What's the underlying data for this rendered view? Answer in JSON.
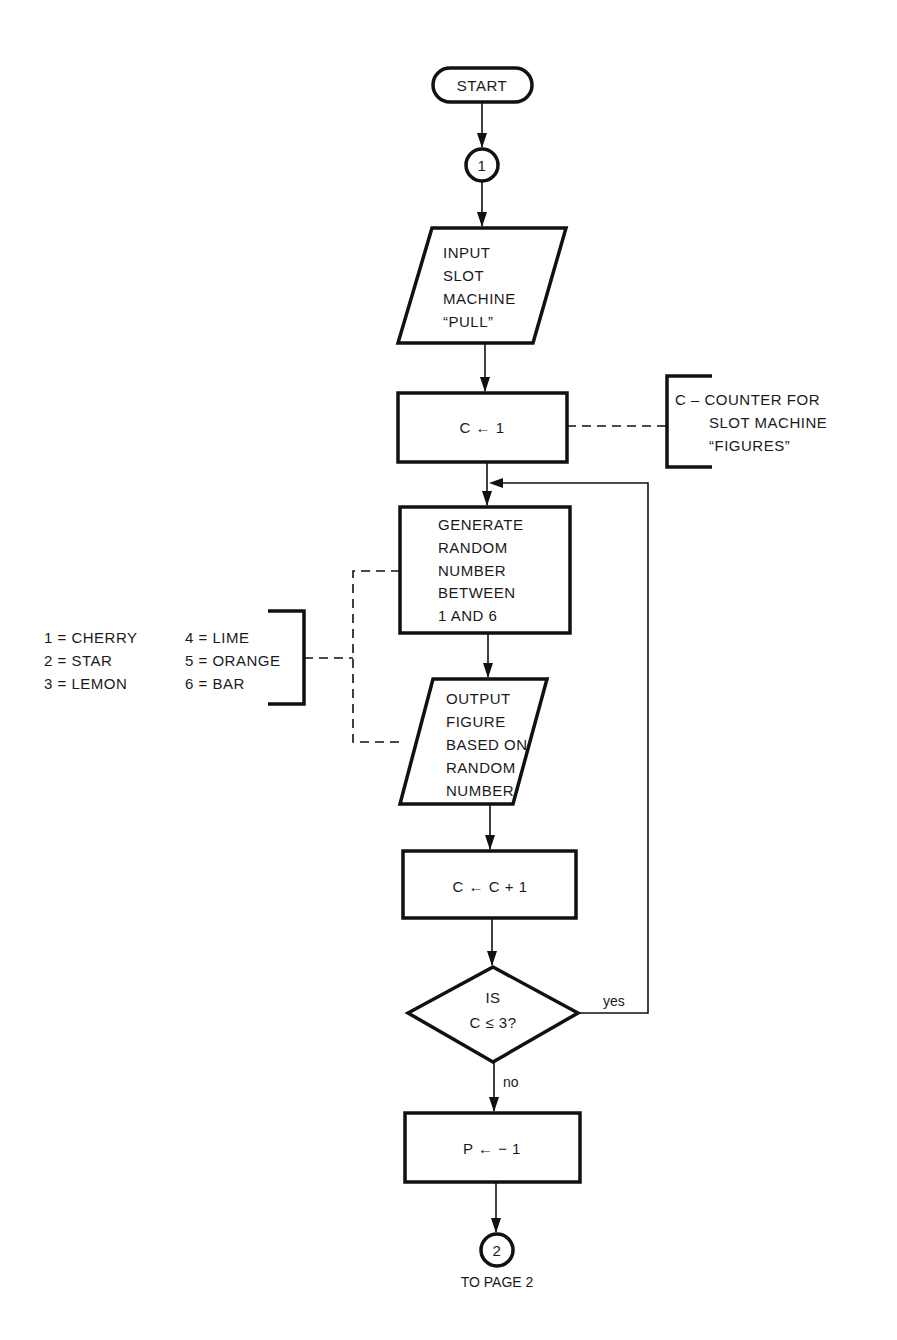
{
  "flowchart": {
    "start": {
      "label": "START"
    },
    "connector_1": {
      "label": "1"
    },
    "input": {
      "lines": [
        "INPUT",
        "SLOT",
        "MACHINE",
        "“PULL”"
      ]
    },
    "init_counter": {
      "label": "C ← 1"
    },
    "counter_note": {
      "lines": [
        "C – COUNTER FOR",
        "SLOT MACHINE",
        "“FIGURES”"
      ]
    },
    "generate": {
      "lines": [
        "GENERATE",
        "RANDOM",
        "NUMBER",
        "BETWEEN",
        "1 AND 6"
      ]
    },
    "legend": {
      "col1": [
        "1 = CHERRY",
        "2 = STAR",
        "3 = LEMON"
      ],
      "col2": [
        "4 = LIME",
        "5 = ORANGE",
        "6 = BAR"
      ]
    },
    "output": {
      "lines": [
        "OUTPUT",
        "FIGURE",
        "BASED ON",
        "RANDOM",
        "NUMBER"
      ]
    },
    "increment": {
      "label": "C ← C + 1"
    },
    "decision": {
      "lines": [
        "IS",
        "C ≤ 3?"
      ],
      "yes_label": "yes",
      "no_label": "no"
    },
    "set_p": {
      "label": "P ←  − 1"
    },
    "connector_2": {
      "label": "2",
      "caption": "TO PAGE 2"
    }
  }
}
